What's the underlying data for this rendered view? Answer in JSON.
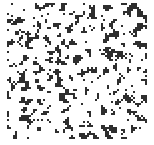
{
  "image": {
    "description": "Random binary noise texture (percolation-like field), dark specks on white",
    "background": "#ffffff",
    "ink": "#2e2e2e",
    "field": {
      "x": 7,
      "y": 3,
      "width": 140,
      "height": 137
    },
    "grain_px": 2,
    "density": 0.42,
    "seed": 1337
  }
}
